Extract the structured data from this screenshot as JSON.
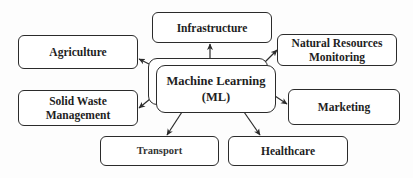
{
  "diagram": {
    "type": "hub-and-spoke",
    "center": {
      "line1": "Machine Learning",
      "line2": "(ML)"
    },
    "nodes": {
      "infrastructure": {
        "label": "Infrastructure"
      },
      "agriculture": {
        "label": "Agriculture"
      },
      "natural_resources": {
        "line1": "Natural Resources",
        "line2": "Monitoring"
      },
      "solid_waste": {
        "line1": "Solid Waste",
        "line2": "Management"
      },
      "marketing": {
        "label": "Marketing"
      },
      "transport": {
        "label": "Transport"
      },
      "healthcare": {
        "label": "Healthcare"
      }
    },
    "edges": [
      {
        "from": "Machine Learning (ML)",
        "to": "Infrastructure"
      },
      {
        "from": "Machine Learning (ML)",
        "to": "Agriculture"
      },
      {
        "from": "Machine Learning (ML)",
        "to": "Natural Resources Monitoring"
      },
      {
        "from": "Machine Learning (ML)",
        "to": "Solid Waste Management"
      },
      {
        "from": "Machine Learning (ML)",
        "to": "Marketing"
      },
      {
        "from": "Machine Learning (ML)",
        "to": "Transport"
      },
      {
        "from": "Machine Learning (ML)",
        "to": "Healthcare"
      }
    ],
    "colors": {
      "stroke": "#2b2b2b",
      "text": "#1e1e1e",
      "background": "#fdfdfd"
    }
  }
}
